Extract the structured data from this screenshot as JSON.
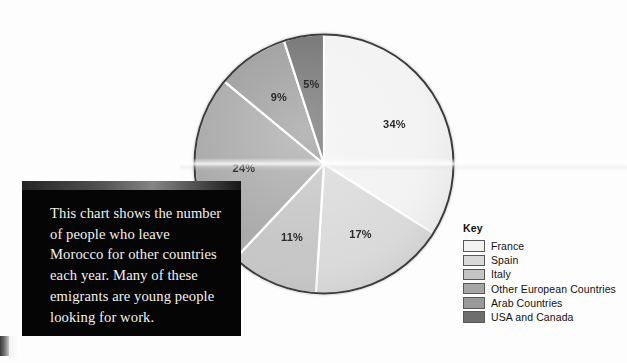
{
  "caption": {
    "text": "This chart shows the number of people who leave Morocco for other countries each year. Many of these emigrants are young people looking for work."
  },
  "legend": {
    "title": "Key",
    "items": [
      {
        "label": "France",
        "color": "#f2f2f2"
      },
      {
        "label": "Spain",
        "color": "#d9d9d9"
      },
      {
        "label": "Italy",
        "color": "#c4c4c4"
      },
      {
        "label": "Other European Countries",
        "color": "#a6a6a6"
      },
      {
        "label": "Arab Countries",
        "color": "#9a9a9a"
      },
      {
        "label": "USA and Canada",
        "color": "#6e6e6e"
      }
    ]
  },
  "chart_data": {
    "type": "pie",
    "title": "",
    "categories": [
      "France",
      "Spain",
      "Italy",
      "Other European Countries",
      "Arab Countries",
      "USA and Canada"
    ],
    "values": [
      34,
      17,
      11,
      24,
      9,
      5
    ],
    "value_labels": [
      "34%",
      "17%",
      "11%",
      "24%",
      "9%",
      "5%"
    ],
    "colors": [
      "#f2f2f2",
      "#d9d9d9",
      "#c4c4c4",
      "#a6a6a6",
      "#9a9a9a",
      "#6e6e6e"
    ],
    "units": "percent",
    "legend_position": "right",
    "start_angle_deg": 0,
    "direction": "clockwise",
    "grid": false,
    "slice_label_radius_frac": 0.62
  }
}
